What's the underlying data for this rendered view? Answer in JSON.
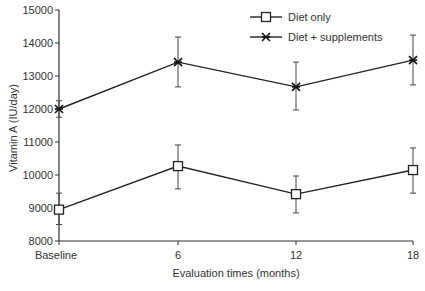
{
  "chart_data": {
    "type": "line",
    "title": "",
    "xlabel": "Evaluation times (months)",
    "ylabel": "Vitamin A (IU/day)",
    "categories": [
      "Baseline",
      "6",
      "12",
      "18"
    ],
    "ylim": [
      8000,
      15000
    ],
    "yticks": [
      8000,
      9000,
      10000,
      11000,
      12000,
      13000,
      14000,
      15000
    ],
    "grid": false,
    "legend_position": "top-right",
    "series": [
      {
        "name": "Diet only",
        "marker": "open-square",
        "values": [
          8950,
          10270,
          9420,
          10150
        ],
        "error_upper": [
          9450,
          10910,
          9970,
          10820
        ],
        "error_lower": [
          8500,
          9580,
          8850,
          9450
        ]
      },
      {
        "name": "Diet + supplements",
        "marker": "asterisk",
        "values": [
          12000,
          13420,
          12670,
          13480
        ],
        "error_upper": [
          12250,
          14180,
          13420,
          14240
        ],
        "error_lower": [
          11750,
          12670,
          11970,
          12730
        ]
      }
    ]
  }
}
